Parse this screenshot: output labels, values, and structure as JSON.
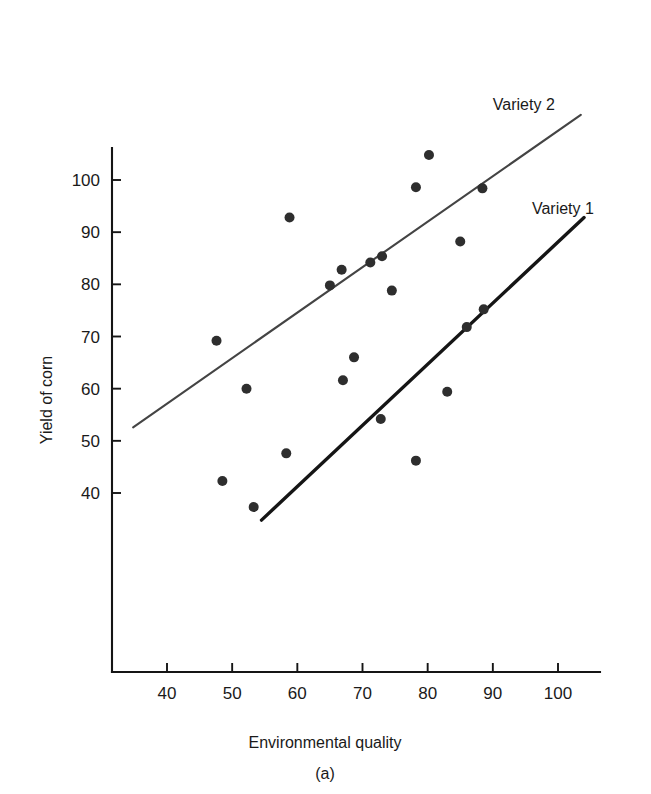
{
  "figure": {
    "caption": "(a)"
  },
  "chart_data": {
    "type": "scatter",
    "title": "",
    "subtitle": "",
    "xlabel": "Environmental quality",
    "ylabel": "Yield of corn",
    "xlim": [
      30,
      105
    ],
    "ylim": [
      32,
      110
    ],
    "grid": false,
    "legend_position": "inline-right-of-lines",
    "xticks": [
      40,
      50,
      60,
      70,
      80,
      90,
      100
    ],
    "xtick_labels": [
      "40",
      "50",
      "60",
      "70",
      "80",
      "90",
      "100"
    ],
    "yticks": [
      40,
      50,
      60,
      70,
      80,
      90,
      100
    ],
    "ytick_labels": [
      "40",
      "50",
      "60",
      "70",
      "80",
      "90",
      "100"
    ],
    "marker_color": "#2e2e2e",
    "marker_size": 5,
    "series": [
      {
        "name": "Variety 1",
        "label": "Variety 1",
        "line_color": "#151515",
        "line_width": 3.4,
        "trendline": {
          "x": [
            54.5,
            104.0
          ],
          "y": [
            34.8,
            92.8
          ]
        },
        "annotation_xy": [
          96,
          93.5
        ],
        "points": [
          {
            "x": 48.5,
            "y": 42.3
          },
          {
            "x": 53.3,
            "y": 37.3
          },
          {
            "x": 58.3,
            "y": 47.6
          },
          {
            "x": 67.0,
            "y": 61.6
          },
          {
            "x": 68.7,
            "y": 66.0
          },
          {
            "x": 72.8,
            "y": 54.2
          },
          {
            "x": 78.2,
            "y": 46.2
          },
          {
            "x": 83.0,
            "y": 59.4
          },
          {
            "x": 86.0,
            "y": 71.8
          },
          {
            "x": 88.6,
            "y": 75.2
          }
        ]
      },
      {
        "name": "Variety 2",
        "label": "Variety 2",
        "line_color": "#444444",
        "line_width": 2.1,
        "trendline": {
          "x": [
            34.8,
            103.5
          ],
          "y": [
            52.6,
            112.5
          ]
        },
        "annotation_xy": [
          90,
          113.5
        ],
        "points": [
          {
            "x": 47.6,
            "y": 69.2
          },
          {
            "x": 52.2,
            "y": 60.0
          },
          {
            "x": 58.8,
            "y": 92.8
          },
          {
            "x": 65.0,
            "y": 79.8
          },
          {
            "x": 66.8,
            "y": 82.8
          },
          {
            "x": 71.2,
            "y": 84.2
          },
          {
            "x": 73.0,
            "y": 85.4
          },
          {
            "x": 74.5,
            "y": 78.8
          },
          {
            "x": 78.2,
            "y": 98.6
          },
          {
            "x": 80.2,
            "y": 104.8
          },
          {
            "x": 85.0,
            "y": 88.2
          },
          {
            "x": 88.4,
            "y": 98.4
          }
        ]
      }
    ]
  }
}
